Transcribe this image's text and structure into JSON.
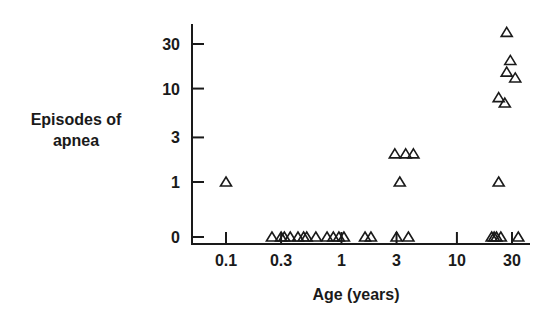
{
  "chart_data": {
    "type": "scatter",
    "title": "",
    "xlabel": "Age (years)",
    "ylabel": "Episodes of apnea",
    "ylabel_lines": [
      "Episodes of",
      "apnea"
    ],
    "xscale": "log",
    "yscale": "log-like (0 at baseline)",
    "x_ticks": [
      "0.1",
      "0.3",
      "1",
      "3",
      "10",
      "30"
    ],
    "y_ticks": [
      "0",
      "1",
      "3",
      "10",
      "30"
    ],
    "marker": "open-triangle",
    "grid": false,
    "legend": null,
    "points": [
      {
        "x": 0.1,
        "y": 1
      },
      {
        "x": 0.25,
        "y": 0
      },
      {
        "x": 0.3,
        "y": 0
      },
      {
        "x": 0.32,
        "y": 0
      },
      {
        "x": 0.36,
        "y": 0
      },
      {
        "x": 0.42,
        "y": 0
      },
      {
        "x": 0.47,
        "y": 0
      },
      {
        "x": 0.5,
        "y": 0
      },
      {
        "x": 0.6,
        "y": 0
      },
      {
        "x": 0.75,
        "y": 0
      },
      {
        "x": 0.85,
        "y": 0
      },
      {
        "x": 0.95,
        "y": 0
      },
      {
        "x": 1.05,
        "y": 0
      },
      {
        "x": 1.6,
        "y": 0
      },
      {
        "x": 1.8,
        "y": 0
      },
      {
        "x": 2.9,
        "y": 2
      },
      {
        "x": 3.2,
        "y": 1
      },
      {
        "x": 3.0,
        "y": 0
      },
      {
        "x": 3.6,
        "y": 2
      },
      {
        "x": 4.2,
        "y": 2
      },
      {
        "x": 3.8,
        "y": 0
      },
      {
        "x": 20,
        "y": 0
      },
      {
        "x": 21,
        "y": 0
      },
      {
        "x": 22,
        "y": 0
      },
      {
        "x": 24,
        "y": 0
      },
      {
        "x": 23,
        "y": 1
      },
      {
        "x": 23,
        "y": 8
      },
      {
        "x": 26,
        "y": 7
      },
      {
        "x": 27,
        "y": 15
      },
      {
        "x": 32,
        "y": 13
      },
      {
        "x": 29,
        "y": 20
      },
      {
        "x": 27,
        "y": 40
      },
      {
        "x": 34,
        "y": 0
      }
    ]
  }
}
